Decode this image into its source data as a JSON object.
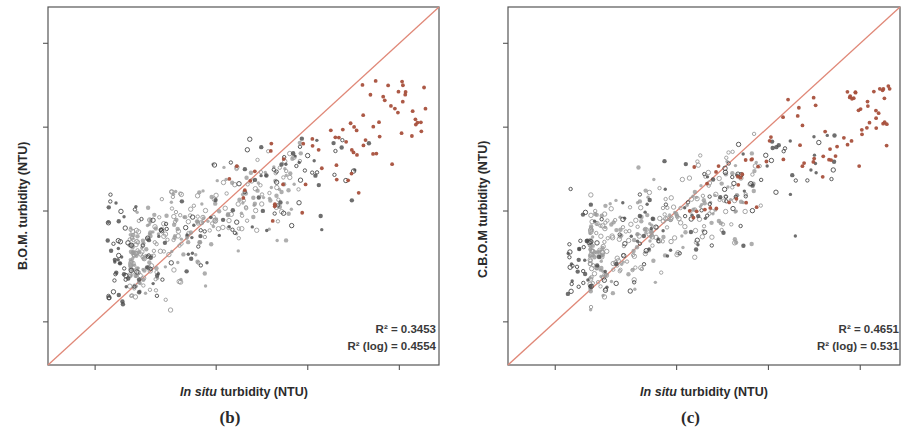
{
  "figure": {
    "width": 921,
    "height": 437,
    "background": "#ffffff"
  },
  "colors": {
    "identity_line": "#e08878",
    "point_gray": "#9a9a9a",
    "point_dark": "#4a4a4a",
    "point_red": "#a8503c",
    "axis": "#555555",
    "text": "#2b2b2b"
  },
  "panels": [
    {
      "id": "panel-b",
      "caption": "(b)",
      "ylabel": "B.O.M. turbidity (NTU)",
      "xlabel_italic": "In situ",
      "xlabel_rest": " turbidity (NTU)",
      "annotations": {
        "r2": "R² = 0.3453",
        "r2_log": "R² (log) = 0.4554"
      }
    },
    {
      "id": "panel-c",
      "caption": "(c)",
      "ylabel": "C.B.O.M turbidity (NTU)",
      "xlabel_italic": "In situ",
      "xlabel_rest": " turbidity (NTU)",
      "annotations": {
        "r2": "R² = 0.4651",
        "r2_log": "R² (log) = 0.531"
      }
    }
  ],
  "chart_data": [
    {
      "type": "scatter",
      "panel": "(b)",
      "title": "",
      "xlabel": "In situ turbidity (NTU)",
      "ylabel": "B.O.M. turbidity (NTU)",
      "xscale": "log",
      "yscale": "log",
      "xlim": [
        0.14,
        2.7
      ],
      "ylim": [
        0.14,
        2.7
      ],
      "xticks": [
        0.2,
        0.5,
        1.0,
        2.0
      ],
      "xticklabels": [
        "0.2",
        "0.5",
        "1.0",
        "2.0"
      ],
      "yticks": [
        0.2,
        0.5,
        1.0,
        2.0
      ],
      "yticklabels": [
        "0.2",
        "0.5",
        "1.0",
        "2.0"
      ],
      "grid": false,
      "legend": "none",
      "reference_line": {
        "type": "identity",
        "label": "1:1 line",
        "color": "#e08878",
        "from": [
          0.14,
          0.14
        ],
        "to": [
          2.7,
          2.7
        ]
      },
      "annotations": [
        "R² = 0.3453",
        "R² (log) = 0.4554"
      ],
      "r_squared": 0.3453,
      "r_squared_log": 0.4554,
      "n_points_approx": 520,
      "series": [
        {
          "name": "low-range (gray)",
          "color": "#9a9a9a",
          "marker": "o",
          "n": 300,
          "x_range": [
            0.26,
            0.95
          ],
          "y_range": [
            0.2,
            0.95
          ]
        },
        {
          "name": "mid-range (dark)",
          "color": "#4a4a4a",
          "marker": "o",
          "n": 150,
          "x_range": [
            0.22,
            1.6
          ],
          "y_range": [
            0.22,
            1.0
          ]
        },
        {
          "name": "high-range (red)",
          "color": "#a8503c",
          "marker": "o",
          "n": 70,
          "x_range": [
            0.55,
            2.5
          ],
          "y_range": [
            0.4,
            1.5
          ]
        }
      ]
    },
    {
      "type": "scatter",
      "panel": "(c)",
      "title": "",
      "xlabel": "In situ turbidity (NTU)",
      "ylabel": "C.B.O.M turbidity (NTU)",
      "xscale": "log",
      "yscale": "log",
      "xlim": [
        0.14,
        2.7
      ],
      "ylim": [
        0.14,
        2.7
      ],
      "xticks": [
        0.2,
        0.5,
        1.0,
        2.0
      ],
      "xticklabels": [
        "0.2",
        "0.5",
        "1.0",
        "2.0"
      ],
      "yticks": [
        0.2,
        0.5,
        1.0,
        2.0
      ],
      "yticklabels": [
        "0.2",
        "0.5",
        "1.0",
        "2.0"
      ],
      "grid": false,
      "legend": "none",
      "reference_line": {
        "type": "identity",
        "label": "1:1 line",
        "color": "#e08878",
        "from": [
          0.14,
          0.14
        ],
        "to": [
          2.7,
          2.7
        ]
      },
      "annotations": [
        "R² = 0.4651",
        "R² (log) = 0.531"
      ],
      "r_squared": 0.4651,
      "r_squared_log": 0.531,
      "n_points_approx": 520,
      "series": [
        {
          "name": "low-range (gray)",
          "color": "#9a9a9a",
          "marker": "o",
          "n": 300,
          "x_range": [
            0.26,
            0.95
          ],
          "y_range": [
            0.22,
            0.95
          ]
        },
        {
          "name": "mid-range (dark)",
          "color": "#4a4a4a",
          "marker": "o",
          "n": 150,
          "x_range": [
            0.22,
            1.8
          ],
          "y_range": [
            0.24,
            1.0
          ]
        },
        {
          "name": "high-range (red)",
          "color": "#a8503c",
          "marker": "o",
          "n": 80,
          "x_range": [
            0.55,
            2.5
          ],
          "y_range": [
            0.45,
            1.5
          ]
        }
      ]
    }
  ]
}
